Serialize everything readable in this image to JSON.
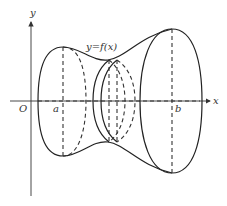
{
  "figure": {
    "labels": {
      "y_axis": "y",
      "x_axis": "x",
      "origin": "O",
      "a": "a",
      "b": "b",
      "curve": "y=f(x)"
    },
    "colors": {
      "stroke": "#222222",
      "background": "#ffffff"
    }
  }
}
